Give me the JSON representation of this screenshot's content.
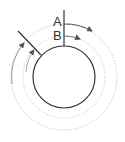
{
  "diagram": {
    "labels": {
      "a": "A",
      "b": "B"
    },
    "colors": {
      "solid": "#333333",
      "dotted": "#c8c8c8",
      "arrow": "#555555"
    },
    "circle": {
      "cx": 64,
      "cy": 77,
      "r": 31
    },
    "rings": {
      "inner_r": 41,
      "outer_r": 53
    }
  }
}
